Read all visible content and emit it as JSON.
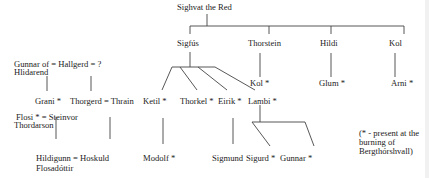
{
  "diagram": {
    "type": "family-tree",
    "people": {
      "sighvat": "Sighvat the Red",
      "sigfus": "Sigfús",
      "thorstein": "Thorstein",
      "hildi": "Hildi",
      "kol_parent": "Kol",
      "kol_child": "Kol *",
      "glum": "Glum *",
      "arni": "Arni *",
      "gunnar_line1": "Gunnar of = Hallgerd = ?",
      "gunnar_line2": "Hlidarend",
      "grani": "Grani *",
      "thorgerd_thrain": "Thorgerd = Thrain",
      "ketil": "Ketil *",
      "thorkel": "Thorkel *",
      "eirik": "Eirik *",
      "lambi": "Lambi *",
      "flosi_line1": "Flosi * = Steinvor",
      "flosi_line2": "Thordarson",
      "hildigunn_line1": "Hildigunn = Hoskuld",
      "hildigunn_line2": "Flosadóttir",
      "modolf": "Modolf *",
      "sigmund": "Sigmund",
      "sigurd": "Sigurd *",
      "gunnar": "Gunnar *"
    },
    "note": {
      "line1": "(* - present at the",
      "line2": "burning of",
      "line3": "Bergthórshvall)"
    },
    "relations": [
      {
        "parent": "Sighvat the Red",
        "children": [
          "Sigfús",
          "Thorstein",
          "Hildi",
          "Kol"
        ]
      },
      {
        "parent": "Sigfús",
        "children": [
          "Ketil",
          "Thorkel",
          "Eirik",
          "Lambi"
        ]
      },
      {
        "parent": "Thorstein",
        "children": [
          "Kol"
        ]
      },
      {
        "parent": "Hildi",
        "children": [
          "Glum"
        ]
      },
      {
        "parent": "Kol",
        "children": [
          "Arni"
        ]
      },
      {
        "parent": "Gunnar of Hlidarend = Hallgerd",
        "children": [
          "Grani"
        ]
      },
      {
        "parent": "Hallgerd = ?",
        "children": [
          "Thorgerd"
        ]
      },
      {
        "parent": "Thorgerd = Thrain",
        "children": [
          "Hoskuld"
        ]
      },
      {
        "parent": "Flosi = Steinvor",
        "children": [
          "Hildigunn"
        ]
      },
      {
        "parent": "Ketil",
        "children": [
          "Modolf"
        ]
      },
      {
        "parent": "Eirik",
        "children": [
          "Sigmund"
        ]
      },
      {
        "parent": "Lambi",
        "children": [
          "Sigurd",
          "Gunnar"
        ]
      }
    ]
  }
}
